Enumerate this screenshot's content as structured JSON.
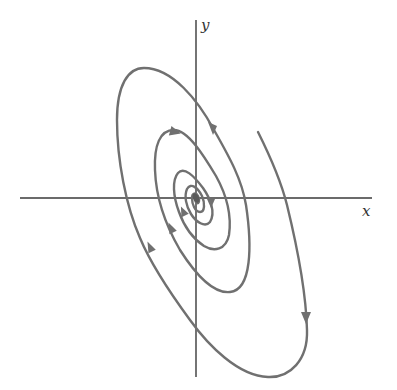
{
  "figure": {
    "type": "phase-portrait",
    "axes": {
      "x_label": "x",
      "y_label": "y",
      "origin": [
        196,
        198
      ]
    },
    "colors": {
      "background": "#ffffff",
      "axis": "#3a3a3a",
      "trajectory": "#707070"
    },
    "trajectory": {
      "direction": "clockwise, spiraling inward",
      "arrows": [
        {
          "id": "arrow-1",
          "position": [
            306,
            318
          ],
          "heading": "down"
        },
        {
          "id": "arrow-2",
          "position": [
            150,
            245
          ],
          "heading": "up-right"
        },
        {
          "id": "arrow-3",
          "position": [
            212,
            128
          ],
          "heading": "down-right"
        },
        {
          "id": "arrow-4",
          "position": [
            171,
            227
          ],
          "heading": "up-right"
        },
        {
          "id": "arrow-5",
          "position": [
            175,
            132
          ],
          "heading": "right"
        },
        {
          "id": "arrow-6",
          "position": [
            183,
            211
          ],
          "heading": "up-right"
        },
        {
          "id": "arrow-7",
          "position": [
            211,
            203
          ],
          "heading": "down"
        }
      ]
    }
  }
}
